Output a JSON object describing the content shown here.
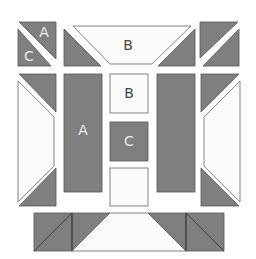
{
  "diagram": {
    "colors": {
      "dark": "#7f7f7f",
      "light": "#fbfbfb",
      "outline": "#555555",
      "background": "#ffffff"
    },
    "labels": {
      "top_left_upper": "A",
      "top_left_lower": "C",
      "top_trapezoid": "B",
      "center_top_box": "B",
      "left_tall_bar": "A",
      "center_middle_box": "C"
    }
  }
}
